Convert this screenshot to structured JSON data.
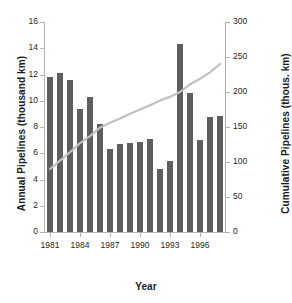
{
  "chart_data": {
    "type": "bar",
    "title": "",
    "xlabel": "Year",
    "ylabel": "Annual Pipelines (thousand km)",
    "ylabel_secondary": "Cumulative Pipelines (thous. km)",
    "grid": false,
    "legend": "none",
    "categories": [
      "1981",
      "1982",
      "1983",
      "1984",
      "1985",
      "1986",
      "1987",
      "1988",
      "1989",
      "1990",
      "1991",
      "1992",
      "1993",
      "1994",
      "1995",
      "1996",
      "1997",
      "1998"
    ],
    "xtick_labels": [
      "1981",
      "1984",
      "1987",
      "1990",
      "1993",
      "1996"
    ],
    "xtick_categories": [
      "1981",
      "1984",
      "1987",
      "1990",
      "1993",
      "1996"
    ],
    "ylim": [
      0,
      16
    ],
    "ytick_labels": [
      "0",
      "2",
      "4",
      "6",
      "8",
      "10",
      "12",
      "14",
      "16"
    ],
    "ylim_secondary": [
      0,
      300
    ],
    "ytick_labels_secondary": [
      "0",
      "50",
      "100",
      "150",
      "200",
      "250",
      "300"
    ],
    "series": [
      {
        "name": "Annual Pipelines (thousand km)",
        "type": "bar",
        "axis": "left",
        "color": "#5e5e5e",
        "values": [
          11.8,
          12.1,
          11.6,
          9.4,
          10.3,
          8.2,
          6.3,
          6.7,
          6.8,
          6.85,
          7.1,
          4.8,
          5.4,
          14.3,
          10.6,
          7.0,
          8.8,
          8.85
        ]
      },
      {
        "name": "Cumulative Pipelines (thous. km)",
        "type": "line",
        "axis": "right",
        "color": "#c0c0c0",
        "values": [
          90,
          102,
          114,
          127,
          137,
          149,
          156,
          162,
          169,
          175,
          181,
          188,
          193,
          200,
          211,
          219,
          228,
          240
        ]
      }
    ]
  },
  "colors": {
    "bar": "#5e5e5e",
    "line": "#c0c0c0",
    "axis": "#b3b3b3",
    "text": "#1a1a1a",
    "background": "#ffffff"
  }
}
